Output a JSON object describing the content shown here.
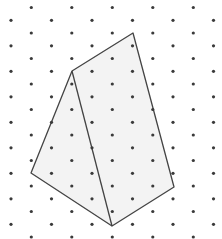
{
  "diagram": {
    "type": "isometric-dot-grid",
    "width": 222,
    "height": 239,
    "grid": {
      "col_spacing": 20.25,
      "row_spacing": 12.75,
      "x_offset": 11,
      "y_offset": 7.5,
      "cols": 11,
      "rows": 19,
      "dot_radius": 1.6,
      "dot_color": "#3a3a3a"
    },
    "shape": {
      "fill": "#f3f3f3",
      "stroke": "#444444",
      "stroke_width": 1.3,
      "vertices": [
        [
          133,
          33
        ],
        [
          174,
          187
        ],
        [
          112,
          226
        ],
        [
          31,
          173
        ],
        [
          72,
          71
        ]
      ],
      "interior_edges": [
        [
          [
            72,
            71
          ],
          [
            112,
            226
          ]
        ]
      ]
    }
  }
}
